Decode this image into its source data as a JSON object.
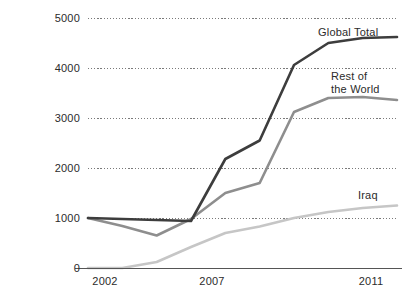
{
  "chart_data": {
    "type": "line",
    "title": "",
    "subtitle": "",
    "xlabel": "",
    "ylabel": "",
    "x": [
      2002,
      2003,
      2004,
      2005,
      2006,
      2007,
      2008,
      2009,
      2010,
      2011
    ],
    "xlim": [
      2002,
      2011
    ],
    "ylim": [
      0,
      5000
    ],
    "x_tick_labels": [
      "2002",
      "2007",
      "2011"
    ],
    "x_tick_values": [
      2002,
      2007,
      2011
    ],
    "y_tick_labels": [
      "0",
      "1000",
      "2000",
      "3000",
      "4000",
      "5000"
    ],
    "y_tick_values": [
      0,
      1000,
      2000,
      3000,
      4000,
      5000
    ],
    "grid": true,
    "grid_style": "dotted-horizontal",
    "legend_position": "inline-right-of-series-end",
    "series": [
      {
        "name": "Global Total",
        "color": "#3d3d3d",
        "values": [
          1000,
          980,
          960,
          940,
          2180,
          2550,
          4060,
          4500,
          4600,
          4620
        ]
      },
      {
        "name": "Rest of the World",
        "color": "#8e8e8e",
        "values": [
          1000,
          840,
          650,
          980,
          1500,
          1700,
          3120,
          3400,
          3420,
          3360
        ]
      },
      {
        "name": "Iraq",
        "color": "#c6c6c6",
        "values": [
          0,
          0,
          120,
          420,
          700,
          830,
          1000,
          1120,
          1200,
          1250
        ]
      }
    ]
  },
  "axis": {
    "baseline_color": "#555555",
    "gridline_color": "#7a7a7a",
    "tick_text_color": "#2b2b2b"
  },
  "labels": {
    "global_total": "Global Total",
    "rest_of_world_line1": "Rest of",
    "rest_of_world_line2": "the World",
    "iraq": "Iraq"
  }
}
